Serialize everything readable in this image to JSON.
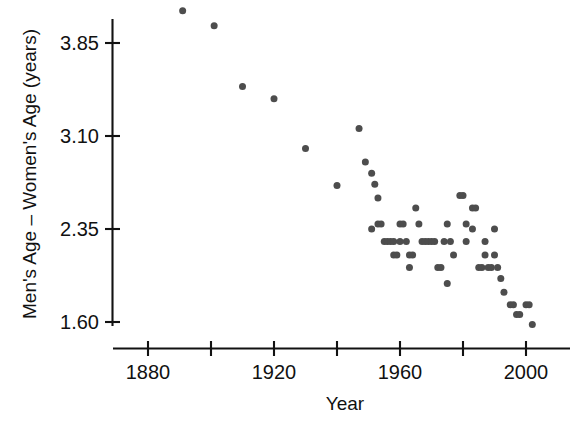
{
  "chart_data": {
    "type": "scatter",
    "title": "",
    "xlabel": "Year",
    "ylabel": "Men's Age – Women's Age (years)",
    "xlim": [
      1866,
      2013
    ],
    "ylim": [
      1.42,
      4.22
    ],
    "grid": false,
    "legend": null,
    "marker": {
      "shape": "circle",
      "color": "#4d4d4d",
      "size_px": 7
    },
    "xticks": [
      1880,
      1900,
      1920,
      1940,
      1960,
      1980,
      2000
    ],
    "xticklabels": [
      "1880",
      "",
      "1920",
      "",
      "1960",
      "",
      "2000"
    ],
    "yticks": [
      1.6,
      2.35,
      3.1,
      3.85
    ],
    "yticklabels": [
      "1.60",
      "2.35",
      "3.10",
      "3.85"
    ],
    "points": [
      {
        "x": 1891,
        "y": 4.11
      },
      {
        "x": 1901,
        "y": 3.99
      },
      {
        "x": 1910,
        "y": 3.5
      },
      {
        "x": 1920,
        "y": 3.4
      },
      {
        "x": 1930,
        "y": 3.0
      },
      {
        "x": 1940,
        "y": 2.7
      },
      {
        "x": 1947,
        "y": 3.16
      },
      {
        "x": 1949,
        "y": 2.89
      },
      {
        "x": 1951,
        "y": 2.8
      },
      {
        "x": 1952,
        "y": 2.71
      },
      {
        "x": 1953,
        "y": 2.6
      },
      {
        "x": 1953,
        "y": 2.39
      },
      {
        "x": 1954,
        "y": 2.39
      },
      {
        "x": 1951,
        "y": 2.35
      },
      {
        "x": 1955,
        "y": 2.25
      },
      {
        "x": 1956,
        "y": 2.25
      },
      {
        "x": 1957,
        "y": 2.25
      },
      {
        "x": 1958,
        "y": 2.25
      },
      {
        "x": 1958,
        "y": 2.14
      },
      {
        "x": 1959,
        "y": 2.14
      },
      {
        "x": 1960,
        "y": 2.39
      },
      {
        "x": 1961,
        "y": 2.39
      },
      {
        "x": 1960,
        "y": 2.25
      },
      {
        "x": 1962,
        "y": 2.25
      },
      {
        "x": 1963,
        "y": 2.14
      },
      {
        "x": 1964,
        "y": 2.14
      },
      {
        "x": 1963,
        "y": 2.04
      },
      {
        "x": 1965,
        "y": 2.52
      },
      {
        "x": 1966,
        "y": 2.39
      },
      {
        "x": 1967,
        "y": 2.25
      },
      {
        "x": 1968,
        "y": 2.25
      },
      {
        "x": 1969,
        "y": 2.25
      },
      {
        "x": 1970,
        "y": 2.25
      },
      {
        "x": 1971,
        "y": 2.25
      },
      {
        "x": 1972,
        "y": 2.04
      },
      {
        "x": 1973,
        "y": 2.04
      },
      {
        "x": 1974,
        "y": 2.25
      },
      {
        "x": 1975,
        "y": 2.39
      },
      {
        "x": 1976,
        "y": 2.25
      },
      {
        "x": 1977,
        "y": 2.14
      },
      {
        "x": 1975,
        "y": 1.91
      },
      {
        "x": 1979,
        "y": 2.62
      },
      {
        "x": 1980,
        "y": 2.62
      },
      {
        "x": 1981,
        "y": 2.39
      },
      {
        "x": 1981,
        "y": 2.25
      },
      {
        "x": 1983,
        "y": 2.52
      },
      {
        "x": 1984,
        "y": 2.52
      },
      {
        "x": 1983,
        "y": 2.35
      },
      {
        "x": 1985,
        "y": 2.04
      },
      {
        "x": 1986,
        "y": 2.04
      },
      {
        "x": 1987,
        "y": 2.25
      },
      {
        "x": 1987,
        "y": 2.14
      },
      {
        "x": 1988,
        "y": 2.04
      },
      {
        "x": 1989,
        "y": 2.04
      },
      {
        "x": 1990,
        "y": 2.35
      },
      {
        "x": 1990,
        "y": 2.14
      },
      {
        "x": 1991,
        "y": 2.04
      },
      {
        "x": 1992,
        "y": 1.95
      },
      {
        "x": 1993,
        "y": 1.84
      },
      {
        "x": 1995,
        "y": 1.74
      },
      {
        "x": 1996,
        "y": 1.74
      },
      {
        "x": 1997,
        "y": 1.66
      },
      {
        "x": 1998,
        "y": 1.66
      },
      {
        "x": 2000,
        "y": 1.74
      },
      {
        "x": 2001,
        "y": 1.74
      },
      {
        "x": 2002,
        "y": 1.58
      }
    ]
  }
}
